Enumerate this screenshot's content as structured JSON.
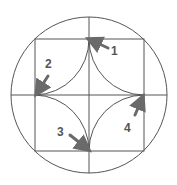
{
  "diagram": {
    "colors": {
      "line": "#555555",
      "arrow": "#6a6a6a",
      "label": "#555555",
      "background": "#ffffff"
    },
    "labels": [
      {
        "id": "1",
        "text": "1"
      },
      {
        "id": "2",
        "text": "2"
      },
      {
        "id": "3",
        "text": "3"
      },
      {
        "id": "4",
        "text": "4"
      }
    ]
  }
}
